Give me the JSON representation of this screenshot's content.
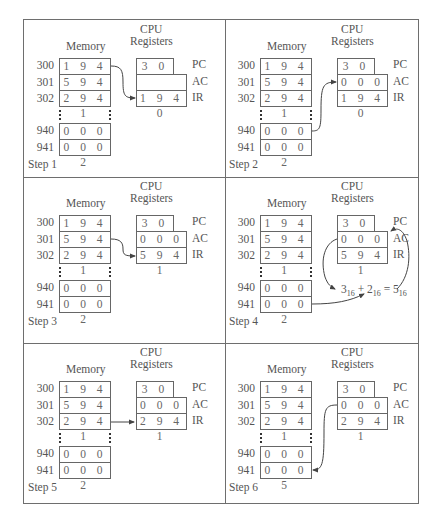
{
  "labels": {
    "memory": "Memory",
    "cpu": "CPU",
    "registers": "Registers",
    "pc": "PC",
    "ac": "AC",
    "ir": "IR"
  },
  "addresses": [
    "300",
    "301",
    "302",
    "940",
    "941"
  ],
  "steps": [
    {
      "title": "Step 1",
      "memory": [
        "1 9 4 0",
        "5 9 4 1",
        "2 9 4 1",
        "0 0 0 3",
        "0 0 0 2"
      ],
      "pc": "3 0 0",
      "ac": "",
      "ir": "1 9 4 0",
      "arrow": "mem300 -> IR"
    },
    {
      "title": "Step 2",
      "memory": [
        "1 9 4 0",
        "5 9 4 1",
        "2 9 4 1",
        "0 0 0 3",
        "0 0 0 2"
      ],
      "pc": "3 0 0",
      "ac": "0 0 0 3",
      "ir": "1 9 4 0",
      "arrow": "mem940 -> AC"
    },
    {
      "title": "Step 3",
      "memory": [
        "1 9 4 0",
        "5 9 4 1",
        "2 9 4 1",
        "0 0 0 3",
        "0 0 0 2"
      ],
      "pc": "3 0 1",
      "ac": "0 0 0 3",
      "ir": "5 9 4 1",
      "arrow": "mem301 -> IR"
    },
    {
      "title": "Step 4",
      "memory": [
        "1 9 4 0",
        "5 9 4 1",
        "2 9 4 1",
        "0 0 0 3",
        "0 0 0 2"
      ],
      "pc": "3 0 1",
      "ac": "0 0 0 5",
      "ir": "5 9 4 1",
      "formula": {
        "a": "3",
        "a_base": "16",
        "plus": "+",
        "b": "2",
        "b_base": "16",
        "eq": "=",
        "c": "5",
        "c_base": "16"
      },
      "arrow": "mem941 -> formula; AC -> formula -> AC"
    },
    {
      "title": "Step 5",
      "memory": [
        "1 9 4 0",
        "5 9 4 1",
        "2 9 4 1",
        "0 0 0 3",
        "0 0 0 2"
      ],
      "pc": "3 0 2",
      "ac": "0 0 0 5",
      "ir": "2 9 4 1",
      "arrow": "mem302 -> IR"
    },
    {
      "title": "Step 6",
      "memory": [
        "1 9 4 0",
        "5 9 4 1",
        "2 9 4 1",
        "0 0 0 3",
        "0 0 0 5"
      ],
      "pc": "3 0 2",
      "ac": "0 0 0 5",
      "ir": "2 9 4 1",
      "arrow": "AC -> mem941"
    }
  ],
  "colors": {
    "line": "#6e6e6e",
    "text": "#555555",
    "arrow": "#444444"
  }
}
